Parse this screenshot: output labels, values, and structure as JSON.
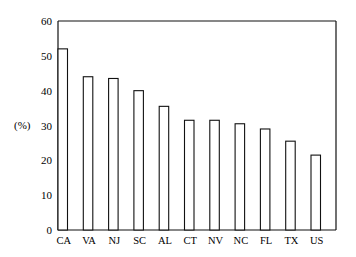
{
  "chart_data": {
    "type": "bar",
    "title": "",
    "xlabel": "",
    "ylabel": "(%)",
    "ylim": [
      0,
      60
    ],
    "yticks": [
      0,
      10,
      20,
      30,
      40,
      50,
      60
    ],
    "grid": false,
    "legend": null,
    "categories": [
      "CA",
      "VA",
      "NJ",
      "SC",
      "AL",
      "CT",
      "NV",
      "NC",
      "FL",
      "TX",
      "US"
    ],
    "values": [
      52,
      44,
      43.5,
      40,
      35.5,
      31.5,
      31.5,
      30.5,
      29,
      25.5,
      21.5
    ]
  }
}
